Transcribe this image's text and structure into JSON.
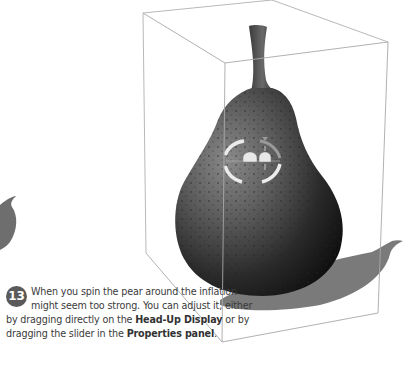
{
  "step": {
    "number": "13",
    "text_part1": "When you spin the pear around the inflation might seem too strong. You can adjust it, either by dragging directly on the ",
    "bold1": "Head-Up Display",
    "text_part2": " or by dragging the slider in the ",
    "bold2": "Properties panel",
    "text_part3": "."
  },
  "scene": {
    "object": "pear",
    "hud": "inflation-head-up-display",
    "colors": {
      "box_line": "#a8a8a8",
      "shadow": "#7a7a7a",
      "pear_dark": "#1a1a1a",
      "pear_mid": "#555555",
      "hud_ring": "#e8e8e8"
    }
  }
}
